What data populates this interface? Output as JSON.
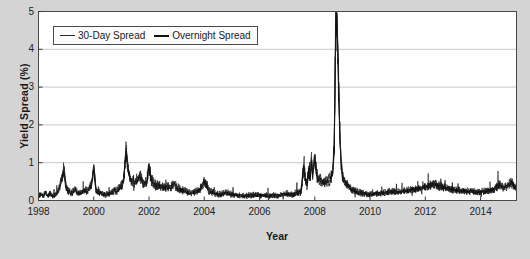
{
  "chart_data": {
    "type": "line",
    "title": "",
    "xlabel": "Year",
    "ylabel": "Yield Spread (%)",
    "xlim": [
      1998,
      2015.3
    ],
    "ylim": [
      0,
      5
    ],
    "grid": true,
    "grid_axis": "y",
    "legend_position": "top-left-inside",
    "yticks": [
      0,
      1,
      2,
      3,
      4,
      5
    ],
    "ytick_labels": [
      "0",
      "1",
      "2",
      "3",
      "4",
      "5"
    ],
    "xticks": [
      1998,
      2000,
      2002,
      2004,
      2006,
      2008,
      2010,
      2012,
      2014
    ],
    "xtick_labels": [
      "1998",
      "2000",
      "2002",
      "2004",
      "2006",
      "2008",
      "2010",
      "2012",
      "2014"
    ],
    "series": [
      {
        "name": "30-Day Spread",
        "color": "#2b2b2b",
        "x": [
          1998.0,
          1998.08,
          1998.17,
          1998.25,
          1998.33,
          1998.42,
          1998.5,
          1998.58,
          1998.67,
          1998.75,
          1998.83,
          1998.92,
          1999.0,
          1999.08,
          1999.17,
          1999.25,
          1999.33,
          1999.42,
          1999.5,
          1999.58,
          1999.67,
          1999.75,
          1999.83,
          1999.92,
          2000.0,
          2000.08,
          2000.17,
          2000.25,
          2000.33,
          2000.42,
          2000.5,
          2000.58,
          2000.67,
          2000.75,
          2000.83,
          2000.92,
          2001.0,
          2001.08,
          2001.17,
          2001.25,
          2001.33,
          2001.42,
          2001.5,
          2001.58,
          2001.67,
          2001.75,
          2001.83,
          2001.92,
          2002.0,
          2002.08,
          2002.17,
          2002.25,
          2002.33,
          2002.42,
          2002.5,
          2002.58,
          2002.67,
          2002.75,
          2002.83,
          2002.92,
          2003.0,
          2003.17,
          2003.33,
          2003.5,
          2003.67,
          2003.83,
          2004.0,
          2004.17,
          2004.33,
          2004.5,
          2004.67,
          2004.83,
          2005.0,
          2005.17,
          2005.33,
          2005.5,
          2005.67,
          2005.83,
          2006.0,
          2006.17,
          2006.33,
          2006.5,
          2006.67,
          2006.83,
          2007.0,
          2007.17,
          2007.33,
          2007.5,
          2007.6,
          2007.67,
          2007.72,
          2007.78,
          2007.83,
          2007.88,
          2007.92,
          2007.96,
          2008.0,
          2008.08,
          2008.17,
          2008.25,
          2008.33,
          2008.42,
          2008.5,
          2008.58,
          2008.65,
          2008.7,
          2008.72,
          2008.74,
          2008.76,
          2008.78,
          2008.8,
          2008.83,
          2008.86,
          2008.9,
          2008.94,
          2008.98,
          2009.0,
          2009.08,
          2009.17,
          2009.25,
          2009.33,
          2009.5,
          2009.67,
          2009.83,
          2010.0,
          2010.25,
          2010.5,
          2010.75,
          2011.0,
          2011.25,
          2011.5,
          2011.75,
          2012.0,
          2012.17,
          2012.33,
          2012.5,
          2012.67,
          2012.83,
          2013.0,
          2013.25,
          2013.5,
          2013.75,
          2014.0,
          2014.17,
          2014.33,
          2014.5,
          2014.67,
          2014.83,
          2015.0,
          2015.1,
          2015.25
        ],
        "values": [
          0.12,
          0.15,
          0.13,
          0.18,
          0.14,
          0.16,
          0.13,
          0.15,
          0.2,
          0.35,
          0.55,
          0.88,
          0.4,
          0.28,
          0.22,
          0.25,
          0.3,
          0.22,
          0.2,
          0.25,
          0.3,
          0.28,
          0.32,
          0.45,
          0.95,
          0.3,
          0.25,
          0.22,
          0.2,
          0.18,
          0.2,
          0.22,
          0.25,
          0.3,
          0.28,
          0.35,
          0.42,
          0.55,
          1.4,
          0.85,
          0.6,
          0.55,
          0.5,
          0.62,
          0.7,
          0.55,
          0.48,
          0.52,
          0.98,
          0.6,
          0.48,
          0.42,
          0.45,
          0.4,
          0.38,
          0.35,
          0.4,
          0.38,
          0.42,
          0.45,
          0.38,
          0.3,
          0.26,
          0.22,
          0.25,
          0.3,
          0.55,
          0.28,
          0.22,
          0.18,
          0.2,
          0.22,
          0.18,
          0.16,
          0.15,
          0.14,
          0.16,
          0.18,
          0.16,
          0.15,
          0.14,
          0.16,
          0.15,
          0.18,
          0.2,
          0.18,
          0.22,
          0.25,
          0.95,
          0.55,
          0.45,
          0.85,
          0.6,
          1.15,
          0.7,
          0.95,
          1.2,
          0.7,
          0.6,
          0.55,
          0.5,
          0.52,
          0.58,
          0.62,
          0.8,
          1.4,
          2.4,
          3.6,
          4.8,
          5.0,
          4.95,
          4.2,
          3.1,
          2.0,
          1.2,
          0.85,
          0.7,
          0.55,
          0.45,
          0.38,
          0.32,
          0.26,
          0.22,
          0.2,
          0.18,
          0.2,
          0.22,
          0.25,
          0.24,
          0.26,
          0.3,
          0.34,
          0.38,
          0.42,
          0.45,
          0.4,
          0.36,
          0.33,
          0.3,
          0.28,
          0.26,
          0.25,
          0.24,
          0.26,
          0.28,
          0.3,
          0.45,
          0.35,
          0.42,
          0.5,
          0.38
        ]
      },
      {
        "name": "Overnight Spread",
        "color": "#111111",
        "x": [
          1998.0,
          1998.08,
          1998.17,
          1998.25,
          1998.33,
          1998.42,
          1998.5,
          1998.58,
          1998.67,
          1998.75,
          1998.83,
          1998.92,
          1999.0,
          1999.08,
          1999.17,
          1999.25,
          1999.33,
          1999.42,
          1999.5,
          1999.58,
          1999.67,
          1999.75,
          1999.83,
          1999.92,
          2000.0,
          2000.08,
          2000.17,
          2000.25,
          2000.33,
          2000.42,
          2000.5,
          2000.58,
          2000.67,
          2000.75,
          2000.83,
          2000.92,
          2001.0,
          2001.08,
          2001.17,
          2001.25,
          2001.33,
          2001.42,
          2001.5,
          2001.58,
          2001.67,
          2001.75,
          2001.83,
          2001.92,
          2002.0,
          2002.08,
          2002.17,
          2002.25,
          2002.33,
          2002.42,
          2002.5,
          2002.58,
          2002.67,
          2002.75,
          2002.83,
          2002.92,
          2003.0,
          2003.17,
          2003.33,
          2003.5,
          2003.67,
          2003.83,
          2004.0,
          2004.17,
          2004.33,
          2004.5,
          2004.67,
          2004.83,
          2005.0,
          2005.17,
          2005.33,
          2005.5,
          2005.67,
          2005.83,
          2006.0,
          2006.17,
          2006.33,
          2006.5,
          2006.67,
          2006.83,
          2007.0,
          2007.17,
          2007.33,
          2007.5,
          2007.6,
          2007.67,
          2007.72,
          2007.78,
          2007.83,
          2007.88,
          2007.92,
          2007.96,
          2008.0,
          2008.08,
          2008.17,
          2008.25,
          2008.33,
          2008.42,
          2008.5,
          2008.58,
          2008.65,
          2008.7,
          2008.72,
          2008.74,
          2008.76,
          2008.78,
          2008.8,
          2008.83,
          2008.86,
          2008.9,
          2008.94,
          2008.98,
          2009.0,
          2009.08,
          2009.17,
          2009.25,
          2009.33,
          2009.5,
          2009.67,
          2009.83,
          2010.0,
          2010.25,
          2010.5,
          2010.75,
          2011.0,
          2011.25,
          2011.5,
          2011.75,
          2012.0,
          2012.17,
          2012.33,
          2012.5,
          2012.67,
          2012.83,
          2013.0,
          2013.25,
          2013.5,
          2013.75,
          2014.0,
          2014.17,
          2014.33,
          2014.5,
          2014.67,
          2014.83,
          2015.0,
          2015.1,
          2015.25
        ],
        "values": [
          0.1,
          0.18,
          0.1,
          0.22,
          0.11,
          0.2,
          0.1,
          0.12,
          0.16,
          0.3,
          0.48,
          0.8,
          0.3,
          0.22,
          0.18,
          0.2,
          0.26,
          0.18,
          0.16,
          0.2,
          0.26,
          0.22,
          0.28,
          0.38,
          0.88,
          0.22,
          0.18,
          0.18,
          0.16,
          0.14,
          0.16,
          0.18,
          0.2,
          0.25,
          0.22,
          0.3,
          0.36,
          0.48,
          1.3,
          0.75,
          0.52,
          0.48,
          0.44,
          0.55,
          0.62,
          0.48,
          0.42,
          0.46,
          0.9,
          0.52,
          0.42,
          0.36,
          0.4,
          0.34,
          0.32,
          0.3,
          0.34,
          0.32,
          0.36,
          0.4,
          0.32,
          0.25,
          0.22,
          0.18,
          0.2,
          0.26,
          0.48,
          0.22,
          0.18,
          0.14,
          0.16,
          0.18,
          0.14,
          0.12,
          0.12,
          0.1,
          0.12,
          0.14,
          0.12,
          0.12,
          0.1,
          0.12,
          0.12,
          0.14,
          0.16,
          0.14,
          0.18,
          0.2,
          0.85,
          0.48,
          0.38,
          0.78,
          0.52,
          1.05,
          0.62,
          0.88,
          1.1,
          0.62,
          0.52,
          0.48,
          0.44,
          0.46,
          0.5,
          0.55,
          0.72,
          1.25,
          2.2,
          3.4,
          4.6,
          4.95,
          4.85,
          4.05,
          2.95,
          1.85,
          1.1,
          0.78,
          0.62,
          0.48,
          0.4,
          0.32,
          0.28,
          0.22,
          0.18,
          0.16,
          0.15,
          0.17,
          0.19,
          0.22,
          0.21,
          0.23,
          0.27,
          0.31,
          0.34,
          0.38,
          0.41,
          0.36,
          0.32,
          0.3,
          0.27,
          0.25,
          0.23,
          0.22,
          0.21,
          0.23,
          0.25,
          0.27,
          0.4,
          0.31,
          0.38,
          0.45,
          0.34
        ]
      }
    ]
  },
  "figure": {
    "background_color": "#d4d4d4",
    "plot_background_color": "#ffffff",
    "axis_color": "#4a4a4a",
    "grid_color": "#c8c8c8",
    "tick_color": "#3a3a3a"
  }
}
